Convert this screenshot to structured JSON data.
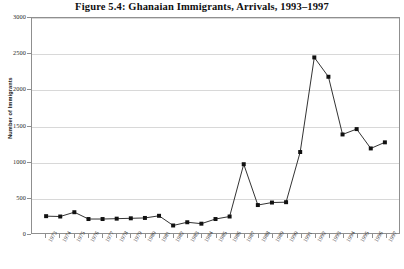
{
  "figure": {
    "title": "Figure 5.4: Ghanaian Immigrants, Arrivals, 1993–1997"
  },
  "chart_data": {
    "type": "line",
    "title": "Figure 5.4: Ghanaian Immigrants, Arrivals, 1993–1997",
    "xlabel": "",
    "ylabel": "Number of Immigrants",
    "ylim": [
      0,
      3000
    ],
    "yticks": [
      0,
      500,
      1000,
      1500,
      2000,
      2500,
      3000
    ],
    "ytick_labels": [
      "0",
      "500",
      "1000",
      "1500",
      "2000",
      "2500",
      "3000"
    ],
    "grid": true,
    "legend": false,
    "marker": "square",
    "line_color": "#1a1a1a",
    "marker_color": "#111111",
    "grid_color": "#d8d8d8",
    "categories": [
      "1973",
      "1974",
      "1975",
      "1976",
      "1977",
      "1978",
      "1979",
      "1980",
      "1981",
      "1982",
      "1983",
      "1984",
      "1985",
      "1986",
      "1987",
      "1988",
      "1989",
      "1990",
      "1991",
      "1992",
      "1993",
      "1994",
      "1995",
      "1996",
      "1997"
    ],
    "values": [
      235,
      230,
      290,
      195,
      195,
      200,
      205,
      210,
      240,
      105,
      150,
      130,
      195,
      230,
      960,
      390,
      425,
      430,
      1130,
      2450,
      2180,
      1375,
      1450,
      1180,
      1265
    ]
  }
}
